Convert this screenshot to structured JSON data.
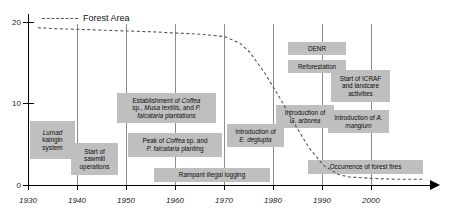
{
  "chart_data": {
    "type": "line",
    "title": "",
    "xlabel": "",
    "ylabel": "",
    "xlim": [
      1925,
      2007
    ],
    "ylim": [
      0,
      21
    ],
    "grid": true,
    "legend_position": "top-left",
    "series": [
      {
        "name": "Forest Area",
        "style": "dashed",
        "color": "#555555",
        "x": [
          1927,
          1930,
          1940,
          1950,
          1960,
          1965,
          1968,
          1970,
          1973,
          1976,
          1979,
          1982,
          1985,
          1988,
          1990,
          1995,
          2000,
          2005
        ],
        "values": [
          19.3,
          19.2,
          19.0,
          18.8,
          18.5,
          18.2,
          17.4,
          16.3,
          13.8,
          10.8,
          7.6,
          4.6,
          2.4,
          1.3,
          1.0,
          0.8,
          0.7,
          0.7
        ]
      }
    ],
    "yticks": [
      0,
      10,
      20
    ],
    "xticks": [
      1930,
      1940,
      1950,
      1960,
      1970,
      1980,
      1990,
      2000
    ],
    "annotations": [
      {
        "id": "lumad-kaingin",
        "text_lines": [
          "Lumad",
          "kaingin",
          "system"
        ],
        "italic_lines": [
          0
        ],
        "x_start": 1927,
        "x_end": 1939
      },
      {
        "id": "sawmill",
        "text_lines": [
          "Start of",
          "sawmill",
          "operations"
        ],
        "italic_lines": [],
        "x_start": 1938,
        "x_end": 1948
      },
      {
        "id": "plantations",
        "text_lines": [
          "Establishment of Coffea",
          "sp., Musa textilis, and P.",
          "falcataria plantations"
        ],
        "italic_lines": [],
        "x_start": 1948,
        "x_end": 1968
      },
      {
        "id": "peak-planting",
        "text_lines": [
          "Peak of Coffea sp. and",
          "P. falcataria planting"
        ],
        "italic_lines": [],
        "x_start": 1950,
        "x_end": 1969
      },
      {
        "id": "illegal-logging",
        "text_lines": [
          "Rampant illegal logging"
        ],
        "italic_lines": [],
        "x_start": 1955,
        "x_end": 1982
      },
      {
        "id": "e-deglupta",
        "text_lines": [
          "Introduction of",
          "E. deglupta"
        ],
        "italic_lines": [],
        "x_start": 1970,
        "x_end": 1982
      },
      {
        "id": "g-arborea",
        "text_lines": [
          "Introduction of",
          "G. arborea"
        ],
        "italic_lines": [],
        "x_start": 1980,
        "x_end": 1991
      },
      {
        "id": "denr",
        "text_lines": [
          "DENR"
        ],
        "italic_lines": [],
        "x_start": 1984,
        "x_end": 1996
      },
      {
        "id": "reforestation",
        "text_lines": [
          "Reforestation"
        ],
        "italic_lines": [],
        "x_start": 1984,
        "x_end": 1996
      },
      {
        "id": "icraf-landcare",
        "text_lines": [
          "Start of ICRAF",
          "and landcare",
          "activities"
        ],
        "italic_lines": [],
        "x_start": 1991,
        "x_end": 2003
      },
      {
        "id": "a-mangium",
        "text_lines": [
          "Introduction of A.",
          "mangium"
        ],
        "italic_lines": [],
        "x_start": 1990,
        "x_end": 2002
      },
      {
        "id": "forest-fires",
        "text_lines": [
          "Occurrence of forest fires"
        ],
        "italic_lines": [],
        "x_start": 1987,
        "x_end": 2006
      }
    ]
  },
  "legend": {
    "forest_area_label": "Forest Area"
  },
  "axes": {
    "y_tick_labels": [
      "0",
      "10",
      "20"
    ],
    "x_tick_labels": [
      "1930",
      "1940",
      "1950",
      "1960",
      "1970",
      "1980",
      "1990",
      "2000"
    ]
  },
  "events": {
    "lumad_kaingin": {
      "line1": "Lumad",
      "line2": "kaingin",
      "line3": "system"
    },
    "sawmill": {
      "line1": "Start of",
      "line2": "sawmill",
      "line3": "operations"
    },
    "plantations": {
      "line1": "Establishment of ",
      "em1": "Coffea",
      "line2": "sp., ",
      "em2": "Musa textilis",
      "line2b": ", and ",
      "em3": "P.",
      "line3a": "falcataria",
      "line3b": " plantations"
    },
    "peak_planting": {
      "line1a": "Peak of ",
      "em1": "Coffea",
      "line1b": " sp. and",
      "em2": "P. falcataria",
      "line2b": " planting"
    },
    "illegal_logging": {
      "text": "Rampant illegal logging"
    },
    "e_deglupta": {
      "line1": "Introduction of",
      "em1": "E. deglupta"
    },
    "g_arborea": {
      "line1": "Introduction of",
      "em1": "G. arborea"
    },
    "denr": {
      "text": "DENR"
    },
    "reforestation": {
      "text": "Reforestation"
    },
    "icraf": {
      "line1": "Start of ICRAF",
      "line2": "and landcare",
      "line3": "activities"
    },
    "a_mangium": {
      "line1a": "Introduction of ",
      "em1": "A.",
      "em2": "mangium"
    },
    "forest_fires": {
      "text": "Occurrence of forest fires"
    }
  }
}
